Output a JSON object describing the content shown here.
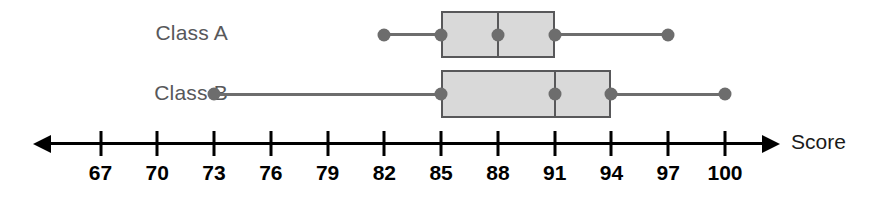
{
  "chart_data": {
    "type": "box",
    "title": "",
    "xlabel": "Score",
    "ylabel": "",
    "orientation": "horizontal",
    "xlim": [
      65.5,
      101.5
    ],
    "grid": false,
    "axis": {
      "label": "Score",
      "ticks": [
        67,
        70,
        73,
        76,
        79,
        82,
        85,
        88,
        91,
        94,
        97,
        100
      ],
      "tick_labels": [
        "67",
        "70",
        "73",
        "76",
        "79",
        "82",
        "85",
        "88",
        "91",
        "94",
        "97",
        "100"
      ],
      "tick_step": 3,
      "arrow_left": true,
      "arrow_right": true
    },
    "categories": [
      "Class A",
      "Class B"
    ],
    "series": [
      {
        "name": "Class A",
        "min": 82,
        "q1": 85,
        "median": 88,
        "q3": 91,
        "max": 97,
        "markers": [
          82,
          85,
          88,
          91,
          97
        ]
      },
      {
        "name": "Class B",
        "min": 73,
        "q1": 85,
        "median": 91,
        "q3": 94,
        "max": 100,
        "markers": [
          73,
          85,
          91,
          94,
          100
        ]
      }
    ],
    "colors": {
      "box_fill": "#d9d9d9",
      "box_stroke": "#58585a",
      "whisker": "#6d6d6d",
      "marker": "#6d6d6d",
      "axis": "#000000",
      "label_text": "#58585a",
      "tick_text": "#000000"
    }
  },
  "labels": {
    "class_a": "Class A",
    "class_b": "Class B",
    "axis_title": "Score"
  }
}
